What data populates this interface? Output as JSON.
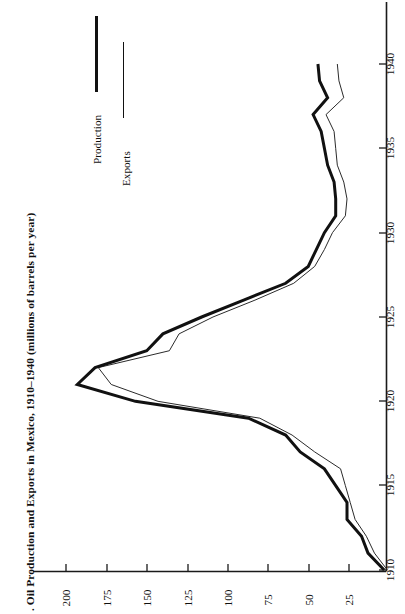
{
  "figure": {
    "number_mark": ".",
    "caption": "Oil Production and Exports in Mexico, 1910–1940 (millions of barrels per year)",
    "orientation": "rotated-90"
  },
  "legend": {
    "position": "upper-left",
    "entries": [
      {
        "label": "Production",
        "style": "thick-solid",
        "color": "#111111"
      },
      {
        "label": "Exports",
        "style": "thin-solid",
        "color": "#2b2b2b"
      }
    ]
  },
  "axes": {
    "value_axis": {
      "title": "millions of barrels per year",
      "ticks": [
        200,
        175,
        150,
        125,
        100,
        75,
        50,
        25
      ],
      "range": [
        0,
        210
      ],
      "placement": "bottom-of-rotated-page"
    },
    "year_axis": {
      "ticks": [
        1910,
        1915,
        1920,
        1925,
        1930,
        1935,
        1940
      ],
      "range": [
        1910,
        1941
      ],
      "placement": "right-of-rotated-page"
    }
  },
  "chart_data": {
    "type": "line",
    "title": "Oil Production and Exports in Mexico, 1910–1940 (millions of barrels per year)",
    "xlabel": "Year",
    "ylabel": "Millions of barrels per year",
    "xlim": [
      1910,
      1941
    ],
    "ylim": [
      0,
      210
    ],
    "grid": false,
    "legend_position": "upper-left",
    "orientation": "rotated 90° (years run vertically, values run horizontally)",
    "x": [
      1910,
      1911,
      1912,
      1913,
      1914,
      1915,
      1916,
      1917,
      1918,
      1919,
      1920,
      1921,
      1922,
      1923,
      1924,
      1925,
      1926,
      1927,
      1928,
      1929,
      1930,
      1931,
      1932,
      1933,
      1934,
      1935,
      1936,
      1937,
      1938,
      1939,
      1940
    ],
    "series": [
      {
        "name": "Production",
        "values": [
          3,
          13,
          17,
          26,
          26,
          33,
          40,
          55,
          64,
          87,
          157,
          193,
          182,
          150,
          140,
          116,
          90,
          64,
          50,
          45,
          40,
          33,
          33,
          34,
          38,
          40,
          42,
          47,
          38,
          43,
          44
        ]
      },
      {
        "name": "Exports",
        "values": [
          1,
          9,
          14,
          21,
          24,
          27,
          30,
          46,
          60,
          80,
          143,
          172,
          180,
          136,
          130,
          109,
          83,
          59,
          46,
          40,
          35,
          27,
          26,
          28,
          32,
          33,
          34,
          39,
          28,
          31,
          32
        ]
      }
    ]
  }
}
